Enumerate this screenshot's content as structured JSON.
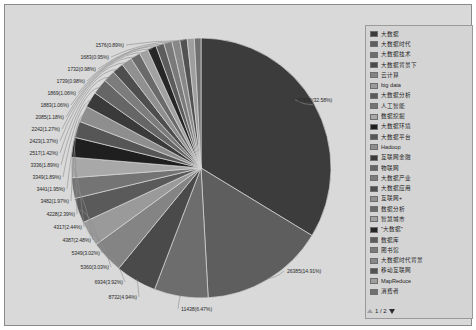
{
  "legend": {
    "pager_label": "1 / 2",
    "prev_icon": "triangle-up-icon",
    "next_icon": "triangle-down-icon",
    "items": [
      {
        "label": "大数据",
        "color": "#3c3c3c"
      },
      {
        "label": "大数据时代",
        "color": "#5e5e5e"
      },
      {
        "label": "大数据技术",
        "color": "#6d6d6d"
      },
      {
        "label": "大数据背景下",
        "color": "#4a4a4a"
      },
      {
        "label": "云计算",
        "color": "#848484"
      },
      {
        "label": "big data",
        "color": "#9a9a9a"
      },
      {
        "label": "大数据分析",
        "color": "#5a5a5a"
      },
      {
        "label": "人工智能",
        "color": "#747474"
      },
      {
        "label": "数据挖掘",
        "color": "#a8a8a8"
      },
      {
        "label": "大数据环境",
        "color": "#1f1f1f"
      },
      {
        "label": "大数据平台",
        "color": "#565656"
      },
      {
        "label": "Hadoop",
        "color": "#8e8e8e"
      },
      {
        "label": "互联网金融",
        "color": "#3a3a3a"
      },
      {
        "label": "物联网",
        "color": "#666666"
      },
      {
        "label": "大数据产业",
        "color": "#7c7c7c"
      },
      {
        "label": "大数据应用",
        "color": "#4e4e4e"
      },
      {
        "label": "互联网+",
        "color": "#909090"
      },
      {
        "label": "数据分析",
        "color": "#6a6a6a"
      },
      {
        "label": "智慧城市",
        "color": "#a2a2a2"
      },
      {
        "label": "\"大数据\"",
        "color": "#262626"
      },
      {
        "label": "数据库",
        "color": "#5c5c5c"
      },
      {
        "label": "图书馆",
        "color": "#7a7a7a"
      },
      {
        "label": "大数据时代背景",
        "color": "#888888"
      },
      {
        "label": "移动互联网",
        "color": "#525252"
      },
      {
        "label": "MapReduce",
        "color": "#9e9e9e"
      },
      {
        "label": "消费者",
        "color": "#707070"
      }
    ]
  },
  "chart_data": {
    "type": "pie",
    "title": "",
    "legend_position": "right",
    "total": 176905,
    "labels": [
      "大数据",
      "大数据时代",
      "大数据技术",
      "大数据背景下",
      "云计算",
      "big data",
      "大数据分析",
      "人工智能",
      "数据挖掘",
      "大数据环境",
      "大数据平台",
      "Hadoop",
      "互联网金融",
      "物联网",
      "大数据产业",
      "大数据应用",
      "互联网+",
      "数据分析",
      "智慧城市",
      "\"大数据\"",
      "数据库",
      "图书馆",
      "大数据时代背景",
      "移动互联网",
      "MapReduce",
      "消费者"
    ],
    "values": [
      57636,
      26385,
      11438,
      8732,
      6934,
      5360,
      5349,
      4387,
      4317,
      4228,
      3482,
      3441,
      3349,
      3336,
      2517,
      2423,
      2242,
      2085,
      1883,
      1869,
      1739,
      1732,
      1683,
      1576,
      1500,
      1400
    ],
    "percents": [
      32.58,
      14.91,
      6.47,
      4.94,
      3.92,
      3.03,
      3.02,
      2.48,
      2.44,
      2.39,
      1.97,
      1.95,
      1.89,
      1.89,
      1.42,
      1.37,
      1.27,
      1.18,
      1.06,
      1.06,
      0.98,
      0.98,
      0.95,
      0.89,
      0.85,
      0.79
    ],
    "colors": [
      "#3c3c3c",
      "#5e5e5e",
      "#6d6d6d",
      "#4a4a4a",
      "#848484",
      "#9a9a9a",
      "#5a5a5a",
      "#747474",
      "#a8a8a8",
      "#1f1f1f",
      "#565656",
      "#8e8e8e",
      "#3a3a3a",
      "#666666",
      "#7c7c7c",
      "#4e4e4e",
      "#909090",
      "#6a6a6a",
      "#a2a2a2",
      "#262626",
      "#5c5c5c",
      "#7a7a7a",
      "#888888",
      "#525252",
      "#9e9e9e",
      "#707070"
    ],
    "visible_data_labels": [
      {
        "text": "57636(32.58%)",
        "x": 293,
        "y": 95,
        "side": "r"
      },
      {
        "text": "26385(14.91%)",
        "x": 282,
        "y": 266,
        "side": "r"
      },
      {
        "text": "11438(6.47%)",
        "x": 176,
        "y": 304,
        "side": "r"
      },
      {
        "text": "8732(4.94%)",
        "x": 132,
        "y": 292,
        "side": "l"
      },
      {
        "text": "6934(3.92%)",
        "x": 118,
        "y": 277,
        "side": "l"
      },
      {
        "text": "5360(3.03%)",
        "x": 104,
        "y": 262,
        "side": "l"
      },
      {
        "text": "5349(3.02%)",
        "x": 95,
        "y": 248,
        "side": "l"
      },
      {
        "text": "4387(2.48%)",
        "x": 86,
        "y": 235,
        "side": "l"
      },
      {
        "text": "4317(2.44%)",
        "x": 77,
        "y": 222,
        "side": "l"
      },
      {
        "text": "4228(2.39%)",
        "x": 70,
        "y": 209,
        "side": "l"
      },
      {
        "text": "3482(1.97%)",
        "x": 64,
        "y": 196,
        "side": "l"
      },
      {
        "text": "3441(1.95%)",
        "x": 60,
        "y": 184,
        "side": "l"
      },
      {
        "text": "3349(1.89%)",
        "x": 56,
        "y": 172,
        "side": "l"
      },
      {
        "text": "3336(1.89%)",
        "x": 54,
        "y": 160,
        "side": "l"
      },
      {
        "text": "2517(1.42%)",
        "x": 53,
        "y": 148,
        "side": "l"
      },
      {
        "text": "2423(1.37%)",
        "x": 53,
        "y": 136,
        "side": "l"
      },
      {
        "text": "2242(1.27%)",
        "x": 55,
        "y": 124,
        "side": "l"
      },
      {
        "text": "2085(1.18%)",
        "x": 59,
        "y": 112,
        "side": "l"
      },
      {
        "text": "1883(1.06%)",
        "x": 64,
        "y": 100,
        "side": "l"
      },
      {
        "text": "1869(1.06%)",
        "x": 71,
        "y": 88,
        "side": "l"
      },
      {
        "text": "1739(0.98%)",
        "x": 80,
        "y": 76,
        "side": "l"
      },
      {
        "text": "1732(0.98%)",
        "x": 91,
        "y": 64,
        "side": "l"
      },
      {
        "text": "1683(0.95%)",
        "x": 104,
        "y": 52,
        "side": "l"
      },
      {
        "text": "1576(0.89%)",
        "x": 119,
        "y": 40,
        "side": "l"
      }
    ]
  }
}
